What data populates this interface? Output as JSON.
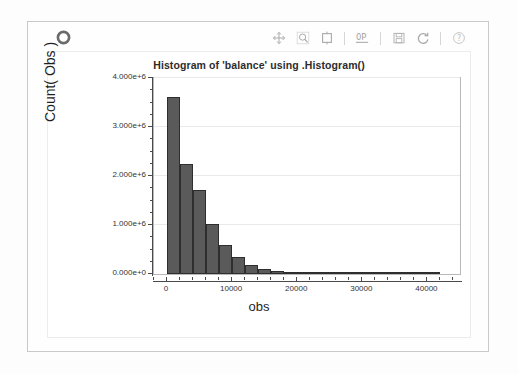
{
  "window": {
    "logo_icon": "ring-logo-icon"
  },
  "toolbar": {
    "buttons": [
      {
        "name": "pan-tool",
        "icon": "move-cross-icon",
        "label": "Pan"
      },
      {
        "name": "zoom-tool",
        "icon": "magnifier-icon",
        "label": "Zoom"
      },
      {
        "name": "box-select-tool",
        "icon": "box-select-icon",
        "label": "Box Select"
      },
      {
        "name": "axes-config-tool",
        "icon": "zero-p-axes-icon",
        "label": "0P"
      },
      {
        "name": "save-tool",
        "icon": "floppy-disk-icon",
        "label": "Save"
      },
      {
        "name": "reset-tool",
        "icon": "refresh-circle-icon",
        "label": "Reset"
      },
      {
        "name": "help-tool",
        "icon": "question-circle-icon",
        "label": "Help"
      }
    ]
  },
  "chart_data": {
    "type": "bar",
    "title": "Histogram of 'balance' using .Histogram()",
    "xlabel": "obs",
    "ylabel": "Count( Obs )",
    "grid": true,
    "legend": "none",
    "xlim": [
      -2000,
      45000
    ],
    "ylim": [
      0,
      4000000
    ],
    "bin_width": 2000,
    "xticks": [
      0,
      10000,
      20000,
      30000,
      40000
    ],
    "xtick_labels": [
      "0",
      "10000",
      "20000",
      "30000",
      "40000"
    ],
    "yticks": [
      0,
      1000000,
      2000000,
      3000000,
      4000000
    ],
    "ytick_labels": [
      "0.000e+0",
      "1.000e+6",
      "2.000e+6",
      "3.000e+6",
      "4.000e+6"
    ],
    "bin_starts": [
      0,
      2000,
      4000,
      6000,
      8000,
      10000,
      12000,
      14000,
      16000,
      18000,
      20000,
      22000,
      24000,
      26000,
      28000,
      30000,
      32000,
      34000,
      36000,
      38000,
      40000
    ],
    "categories": [
      "0-2k",
      "2k-4k",
      "4k-6k",
      "6k-8k",
      "8k-10k",
      "10k-12k",
      "12k-14k",
      "14k-16k",
      "16k-18k",
      "18k-20k",
      "20k-22k",
      "22k-24k",
      "24k-26k",
      "26k-28k",
      "28k-30k",
      "30k-32k",
      "32k-34k",
      "34k-36k",
      "36k-38k",
      "38k-40k",
      "40k-42k"
    ],
    "values": [
      3620000,
      2240000,
      1710000,
      1020000,
      590000,
      340000,
      190000,
      100000,
      55000,
      30000,
      16000,
      9000,
      6000,
      4000,
      3000,
      2500,
      2000,
      1800,
      1500,
      1200,
      9000
    ],
    "bar_color": "#5a5a5a",
    "bar_edge_color": "#2e2e2e",
    "grid_color": "#e9e9e9",
    "axis_color": "#4a4a4a"
  }
}
